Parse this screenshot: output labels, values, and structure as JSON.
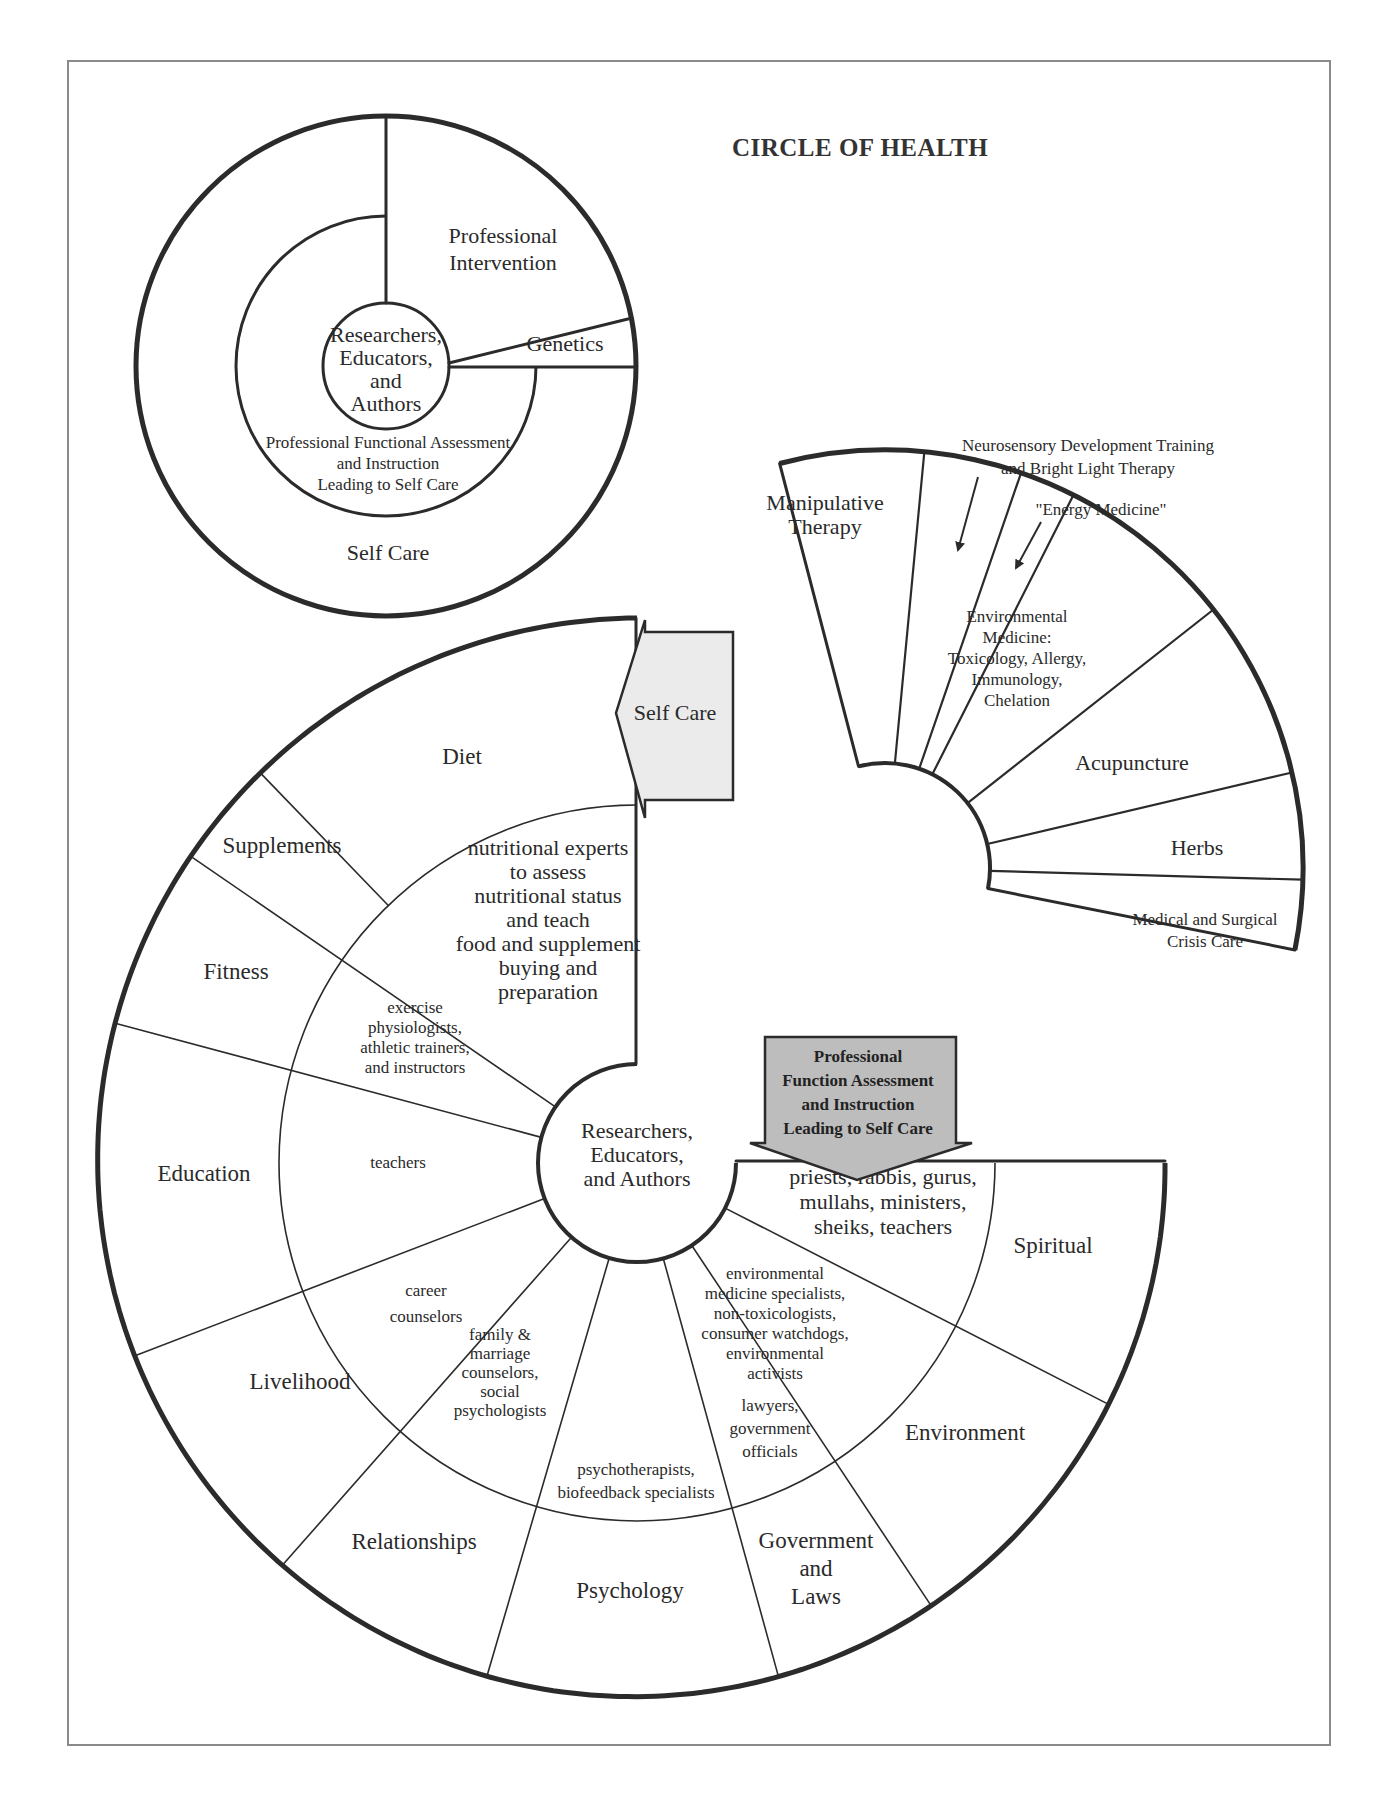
{
  "title": "CIRCLE OF HEALTH",
  "colors": {
    "line": "#2b2b2b",
    "frame": "#8a8a8a",
    "self_care_arrow_fill": "#ebebeb",
    "professional_arrow_fill": "#bdbdbd"
  },
  "top_circle": {
    "center": [
      "Researchers,",
      "Educators,",
      "and",
      "Authors"
    ],
    "middle_ring": [
      "Professional Functional Assessment",
      "and Instruction",
      "Leading to Self Care"
    ],
    "outer_ring": "Self Care",
    "professional_intervention": [
      "Professional",
      "Intervention"
    ],
    "genetics": "Genetics"
  },
  "fan": {
    "segments": [
      {
        "label": [
          "Manipulative",
          "Therapy"
        ]
      },
      {
        "label": []
      },
      {
        "label": []
      },
      {
        "label": [
          "Environmental",
          "Medicine:",
          "Toxicology, Allergy,",
          "Immunology,",
          "Chelation"
        ]
      },
      {
        "label": [
          "Acupuncture"
        ]
      },
      {
        "label": [
          "Herbs"
        ]
      },
      {
        "label": [
          "Medical and Surgical",
          "Crisis Care"
        ]
      }
    ],
    "callouts": [
      {
        "label": [
          "Neurosensory Development Training",
          "and Bright Light Therapy"
        ]
      },
      {
        "label": [
          "\"Energy Medicine\""
        ]
      }
    ]
  },
  "spiral": {
    "center": [
      "Researchers,",
      "Educators,",
      "and Authors"
    ],
    "self_care_arrow": "Self Care",
    "professional_arrow": [
      "Professional",
      "Function Assessment",
      "and Instruction",
      "Leading to Self Care"
    ],
    "sectors": [
      {
        "outer": [
          "Diet"
        ],
        "inner": [
          "nutritional experts",
          "to assess",
          "nutritional status",
          "and teach",
          "food and supplement",
          "buying and",
          "preparation"
        ]
      },
      {
        "outer": [
          "Supplements"
        ],
        "inner": []
      },
      {
        "outer": [
          "Fitness"
        ],
        "inner": [
          "exercise",
          "physiologists,",
          "athletic trainers,",
          "and instructors"
        ]
      },
      {
        "outer": [
          "Education"
        ],
        "inner": [
          "teachers"
        ]
      },
      {
        "outer": [
          "Livelihood"
        ],
        "inner": [
          "career",
          "counselors"
        ]
      },
      {
        "outer": [
          "Relationships"
        ],
        "inner": [
          "family &",
          "marriage",
          "counselors,",
          "social",
          "psychologists"
        ]
      },
      {
        "outer": [
          "Psychology"
        ],
        "inner": [
          "psychotherapists,",
          "biofeedback specialists"
        ]
      },
      {
        "outer": [
          "Government",
          "and",
          "Laws"
        ],
        "inner": [
          "lawyers,",
          "government",
          "officials"
        ]
      },
      {
        "outer": [
          "Environment"
        ],
        "inner": [
          "environmental",
          "medicine specialists,",
          "non-toxicologists,",
          "consumer watchdogs,",
          "environmental",
          "activists"
        ]
      },
      {
        "outer": [
          "Spiritual"
        ],
        "inner": [
          "priests, rabbis, gurus,",
          "mullahs, ministers,",
          "sheiks, teachers"
        ]
      }
    ]
  }
}
